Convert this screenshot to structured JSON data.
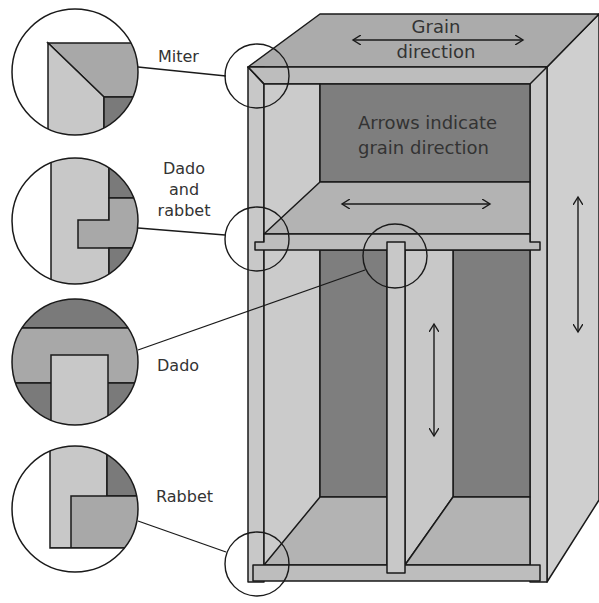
{
  "figure": {
    "colors": {
      "light": "#c8c8c8",
      "mid": "#a8a8a8",
      "dark": "#7a7a7a",
      "line": "#1a1a1a",
      "background": "#ffffff",
      "text": "#333333"
    }
  },
  "labels": {
    "grain_top_line1": "Grain",
    "grain_top_line2": "direction",
    "back_panel_line1": "Arrows indicate",
    "back_panel_line2": "grain direction"
  },
  "callouts": [
    {
      "id": "miter",
      "lines": [
        "Miter"
      ]
    },
    {
      "id": "dado-and-rabbet",
      "lines": [
        "Dado",
        "and",
        "rabbet"
      ]
    },
    {
      "id": "dado",
      "lines": [
        "Dado"
      ]
    },
    {
      "id": "rabbet",
      "lines": [
        "Rabbet"
      ]
    }
  ],
  "arrows": [
    {
      "id": "top-grain-arrow",
      "orientation": "horizontal"
    },
    {
      "id": "shelf-grain-arrow",
      "orientation": "horizontal"
    },
    {
      "id": "side-grain-arrow",
      "orientation": "vertical"
    },
    {
      "id": "divider-grain-arrow",
      "orientation": "vertical"
    }
  ]
}
